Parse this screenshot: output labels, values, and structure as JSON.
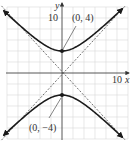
{
  "figure": {
    "type": "hyperbola-graph",
    "axes": {
      "x_label": "x",
      "y_label": "y",
      "x_tick_label": "10",
      "y_tick_label": "10"
    },
    "points": [
      {
        "label": "(0, 4)",
        "x": 0,
        "y": 4
      },
      {
        "label": "(0, −4)",
        "x": 0,
        "y": -4
      }
    ],
    "curve": {
      "equation": "y^2/16 - x^2/16 = 1",
      "a": 4,
      "b": 4
    },
    "asymptotes": [
      "y = x",
      "y = -x"
    ],
    "grid": {
      "spacing": 2,
      "x_range": [
        -10,
        12
      ],
      "y_range": [
        -12,
        12
      ]
    },
    "colors": {
      "curve": "#1a1a1a",
      "grid": "#d9d9d9",
      "axis": "#444444"
    }
  }
}
